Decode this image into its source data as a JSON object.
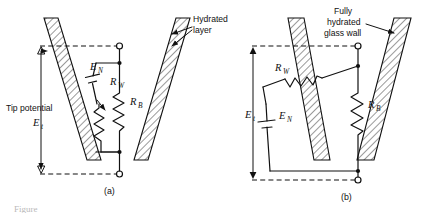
{
  "figure": {
    "domain_kind": "scientific-diagram",
    "background_color": "#ffffff",
    "ink_color": "#111111",
    "width": 441,
    "height": 213
  },
  "panels": [
    {
      "id": "a",
      "label": "(a)",
      "annotations": [
        {
          "name": "hydrated-layer",
          "lines": [
            "Hydrated",
            "layer"
          ],
          "arrow": "points-left-into-wall"
        }
      ],
      "dimension": {
        "name": "tip-potential",
        "lines": [
          "Tip  potential"
        ],
        "symbol": "E",
        "subscript": "t",
        "arrow": "double-headed-vertical"
      },
      "components": [
        {
          "name": "emf-source",
          "symbol": "E",
          "subscript": "N",
          "type": "battery"
        },
        {
          "name": "wall-resistance",
          "symbol": "R",
          "subscript": "W",
          "type": "resistor-zigzag"
        },
        {
          "name": "bulk-resistance",
          "symbol": "R",
          "subscript": "B",
          "type": "resistor-zigzag"
        }
      ],
      "terminals": [
        "top-open-circle",
        "bottom-open-circle"
      ]
    },
    {
      "id": "b",
      "label": "(b)",
      "annotations": [
        {
          "name": "fully-hydrated-glass-wall",
          "lines": [
            "Fully",
            "hydrated",
            "glass  wall"
          ],
          "arrow": "points-right-into-wall"
        }
      ],
      "dimension": {
        "name": "tip-potential",
        "lines": [],
        "symbol": "E",
        "subscript": "t",
        "arrow": "double-headed-vertical"
      },
      "components": [
        {
          "name": "wall-resistance",
          "symbol": "R",
          "subscript": "W",
          "type": "resistor-zigzag-horizontal"
        },
        {
          "name": "emf-source",
          "symbol": "E",
          "subscript": "N",
          "type": "battery"
        },
        {
          "name": "bulk-resistance",
          "symbol": "R",
          "subscript": "B",
          "type": "resistor-zigzag"
        }
      ],
      "terminals": [
        "top-open-circle",
        "bottom-open-circle"
      ]
    }
  ],
  "caption_fragment": {
    "name": "clipped-caption",
    "text": "Figure",
    "note": "partially cropped at bottom edge"
  }
}
